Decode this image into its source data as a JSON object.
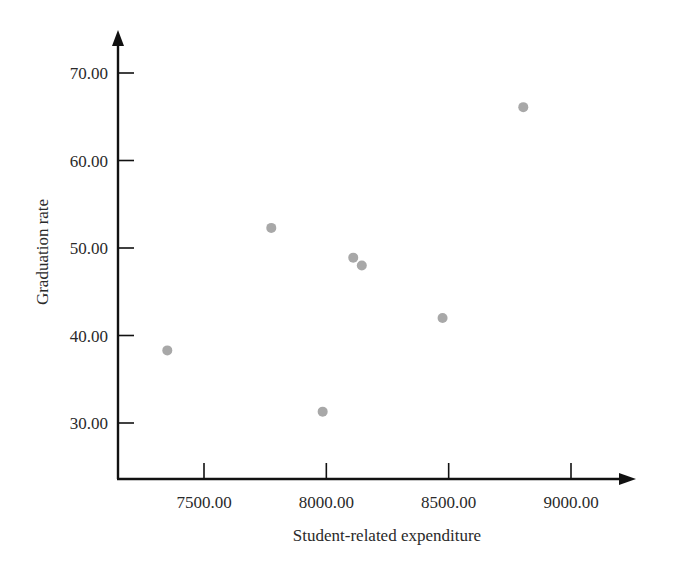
{
  "chart_data": {
    "type": "scatter",
    "title": "",
    "xlabel": "Student-related expenditure",
    "ylabel": "Graduation rate",
    "xlim": [
      7150,
      9250
    ],
    "ylim": [
      23.5,
      76
    ],
    "x_ticks": [
      7500,
      8000,
      8500,
      9000
    ],
    "x_tick_labels": [
      "7500.00",
      "8000.00",
      "8500.00",
      "9000.00"
    ],
    "y_ticks": [
      30,
      40,
      50,
      60,
      70
    ],
    "y_tick_labels": [
      "30.00",
      "40.00",
      "50.00",
      "60.00",
      "70.00"
    ],
    "grid": false,
    "legend": null,
    "series": [
      {
        "name": "schools",
        "color": "#a8a8a8",
        "points": [
          {
            "x": 7350,
            "y": 38.3
          },
          {
            "x": 7775,
            "y": 52.3
          },
          {
            "x": 8110,
            "y": 48.9
          },
          {
            "x": 8145,
            "y": 48.0
          },
          {
            "x": 7985,
            "y": 31.3
          },
          {
            "x": 8475,
            "y": 42.0
          },
          {
            "x": 8805,
            "y": 66.1
          }
        ]
      }
    ]
  },
  "colors": {
    "axis": "#111111",
    "point": "#a8a8a8",
    "text": "#2a2a2a"
  }
}
